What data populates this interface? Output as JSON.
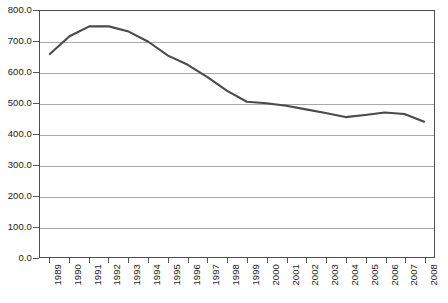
{
  "chart_data": {
    "type": "line",
    "title": "",
    "subtitle": "",
    "xlabel": "",
    "ylabel": "",
    "grid": true,
    "legend": false,
    "legend_position": "none",
    "line_color": "#4a4a4a",
    "gridline_color": "#a9a9a9",
    "border_color": "#4d4d4d",
    "background_color": "#ffffff",
    "ylim": [
      0.0,
      800.0
    ],
    "ytick_step": 100.0,
    "ytick_labels": [
      "800.0",
      "700.0",
      "600.0",
      "500.0",
      "400.0",
      "300.0",
      "200.0",
      "100.0",
      "0.0"
    ],
    "ytick_values": [
      800.0,
      700.0,
      600.0,
      500.0,
      400.0,
      300.0,
      200.0,
      100.0,
      0.0
    ],
    "categories": [
      "1989",
      "1990",
      "1991",
      "1992",
      "1993",
      "1994",
      "1995",
      "1996",
      "1997",
      "1998",
      "1999",
      "2000",
      "2001",
      "2002",
      "2003",
      "2004",
      "2005",
      "2006",
      "2007",
      "2008"
    ],
    "values": [
      660,
      718,
      750,
      750,
      733,
      700,
      655,
      625,
      585,
      540,
      505,
      500,
      492,
      480,
      468,
      455,
      462,
      470,
      465,
      440
    ]
  }
}
